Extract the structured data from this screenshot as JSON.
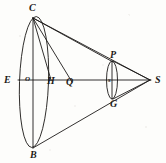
{
  "figure": {
    "background_color": "#fdfdfb",
    "ink_color": "#1c1a18",
    "stroke_width": 0.9
  },
  "points": [
    {
      "id": "C",
      "label": "C",
      "x": 33,
      "y": 17,
      "label_x": 29,
      "label_y": 3,
      "size": "norm"
    },
    {
      "id": "E",
      "label": "E",
      "x": 20,
      "y": 80,
      "label_x": 4,
      "label_y": 75,
      "size": "norm"
    },
    {
      "id": "O",
      "label": "O",
      "x": 33,
      "y": 80,
      "label_x": 25,
      "label_y": 76,
      "size": "small"
    },
    {
      "id": "H",
      "label": "H",
      "x": 51,
      "y": 80,
      "label_x": 47,
      "label_y": 76,
      "size": "norm"
    },
    {
      "id": "Q",
      "label": "Q",
      "x": 71,
      "y": 80,
      "label_x": 66,
      "label_y": 77,
      "size": "norm"
    },
    {
      "id": "P",
      "label": "P",
      "x": 113,
      "y": 62,
      "label_x": 110,
      "label_y": 50,
      "size": "norm"
    },
    {
      "id": "s",
      "label": "s",
      "x": 112,
      "y": 80,
      "label_x": 108,
      "label_y": 77,
      "size": "small"
    },
    {
      "id": "G",
      "label": "G",
      "x": 113,
      "y": 99,
      "label_x": 110,
      "label_y": 99,
      "size": "norm"
    },
    {
      "id": "S",
      "label": "S",
      "x": 150,
      "y": 80,
      "label_x": 155,
      "label_y": 75,
      "size": "norm"
    },
    {
      "id": "B",
      "label": "B",
      "x": 33,
      "y": 148,
      "label_x": 30,
      "label_y": 150,
      "size": "norm"
    }
  ],
  "ellipses": [
    {
      "id": "large-ellipse",
      "name": "large-ellipse",
      "cx": 34,
      "cy": 82,
      "rx": 14.5,
      "ry": 65.5,
      "rotation": 2
    },
    {
      "id": "small-ellipse",
      "name": "small-ellipse",
      "cx": 112,
      "cy": 80,
      "rx": 5.5,
      "ry": 19,
      "rotation": 0
    }
  ],
  "lines": [
    {
      "id": "axis-ES",
      "name": "horizontal-axis-E-to-S",
      "x1": 18,
      "y1": 80,
      "x2": 151,
      "y2": 80
    },
    {
      "id": "chord-CB",
      "name": "vertical-chord-C-to-B",
      "x1": 33,
      "y1": 18,
      "x2": 33,
      "y2": 148
    },
    {
      "id": "ray-CS",
      "name": "ray-C-to-S",
      "x1": 33,
      "y1": 18,
      "x2": 150,
      "y2": 80
    },
    {
      "id": "ray-CP",
      "name": "ray-C-to-P",
      "x1": 33,
      "y1": 18,
      "x2": 113,
      "y2": 62
    },
    {
      "id": "ray-CQ",
      "name": "ray-C-to-Q",
      "x1": 33,
      "y1": 18,
      "x2": 72,
      "y2": 82
    },
    {
      "id": "ray-CH",
      "name": "ray-C-to-H",
      "x1": 33,
      "y1": 18,
      "x2": 51,
      "y2": 80
    },
    {
      "id": "ray-BS",
      "name": "ray-B-to-S",
      "x1": 33,
      "y1": 148,
      "x2": 150,
      "y2": 80
    },
    {
      "id": "ray-PS",
      "name": "ray-P-to-S",
      "x1": 113,
      "y1": 61,
      "x2": 150,
      "y2": 80
    },
    {
      "id": "ray-GS",
      "name": "ray-G-to-S",
      "x1": 113,
      "y1": 99,
      "x2": 150,
      "y2": 80
    },
    {
      "id": "chord-PG",
      "name": "vertical-chord-P-to-G",
      "x1": 112,
      "y1": 61,
      "x2": 112,
      "y2": 99
    }
  ]
}
